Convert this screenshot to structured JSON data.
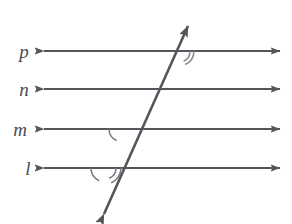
{
  "figure": {
    "background_color": "#ffffff",
    "stroke_color": "#55555c",
    "label_color": "#4a4a50",
    "stroke_width": 2,
    "width": 292,
    "height": 224
  },
  "parallel_lines": [
    {
      "id": "line-p",
      "label": "p",
      "label_x": 24,
      "label_y": 58,
      "y": 51,
      "x_start": 44,
      "x_end": 280,
      "arrow_start": true,
      "arrow_end": true
    },
    {
      "id": "line-n",
      "label": "n",
      "label_x": 24,
      "label_y": 96,
      "y": 89,
      "x_start": 44,
      "x_end": 280,
      "arrow_start": true,
      "arrow_end": true
    },
    {
      "id": "line-m",
      "label": "m",
      "label_x": 18,
      "label_y": 136,
      "y": 129,
      "x_start": 44,
      "x_end": 280,
      "arrow_start": true,
      "arrow_end": true
    },
    {
      "id": "line-l",
      "label": "l",
      "label_x": 28,
      "label_y": 175,
      "y": 168,
      "x_start": 44,
      "x_end": 280,
      "arrow_start": true,
      "arrow_end": true
    }
  ],
  "transversal": {
    "id": "transversal-line",
    "x1": 104,
    "y1": 214,
    "x2": 188,
    "y2": 26,
    "arrow_start": true,
    "arrow_end": true
  },
  "angle_marks": [
    {
      "id": "angle-arc-p-lower-right",
      "at_line": "p",
      "position": "lower-right",
      "arc_count": 2,
      "cx": 179,
      "cy": 51,
      "radii": [
        11,
        15
      ]
    },
    {
      "id": "angle-arc-m-lower-left",
      "at_line": "m",
      "position": "lower-left",
      "arc_count": 1,
      "cx": 122,
      "cy": 129,
      "radii": [
        13
      ]
    },
    {
      "id": "angle-arc-l-lower-left",
      "at_line": "l",
      "position": "lower-left",
      "arc_count": 1,
      "cx": 105,
      "cy": 168,
      "radii": [
        14
      ]
    },
    {
      "id": "angle-arc-l-lower-right",
      "at_line": "l",
      "position": "lower-right",
      "arc_count": 2,
      "cx": 105,
      "cy": 168,
      "radii": [
        11,
        16
      ]
    }
  ]
}
